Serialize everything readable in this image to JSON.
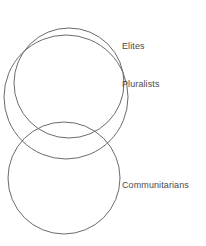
{
  "diagram": {
    "type": "venn-three-circle",
    "background_color": "#ffffff",
    "stroke_color": "#6b6b6b",
    "label_color": "#4a4a4a",
    "labels": {
      "elites": "Elites",
      "pluralists": "Pluralists",
      "communitarians": "Communitarians"
    },
    "circles": [
      {
        "name": "elites",
        "cx": 69,
        "cy": 83,
        "r": 55
      },
      {
        "name": "pluralists",
        "cx": 66,
        "cy": 97,
        "r": 62
      },
      {
        "name": "communitarians",
        "cx": 64,
        "cy": 178,
        "r": 56
      }
    ]
  }
}
